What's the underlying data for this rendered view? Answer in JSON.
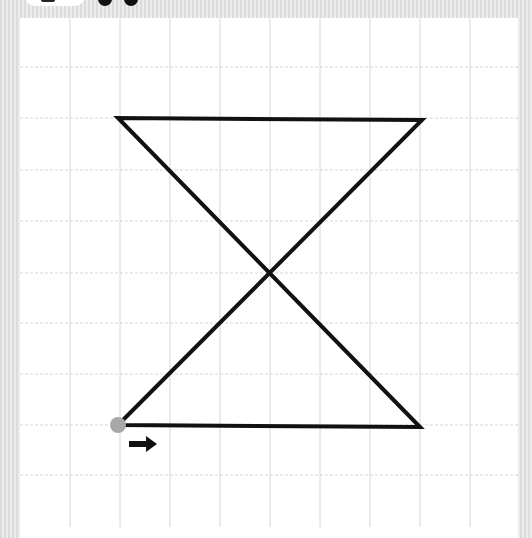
{
  "canvas": {
    "background_color": "#e4e4e4",
    "board_color": "#ffffff",
    "grid": {
      "line_color": "#d6d6d6",
      "vertical_x": [
        70,
        120,
        170,
        220,
        270,
        320,
        370,
        420,
        470
      ],
      "horizontal_y": [
        67,
        118,
        170,
        221,
        273,
        323,
        374,
        425,
        475
      ]
    },
    "path": {
      "stroke_color": "#111111",
      "stroke_width": 4,
      "points": [
        [
          118,
          425
        ],
        [
          420,
          427
        ],
        [
          118,
          118
        ],
        [
          422,
          120
        ],
        [
          118,
          425
        ]
      ]
    },
    "start_point": {
      "x": 118,
      "y": 425,
      "color": "#a8a8a8",
      "radius": 8
    },
    "direction_arrow": {
      "icon": "arrow-right-icon",
      "x": 129,
      "y": 444,
      "color": "#111111"
    }
  },
  "top_bar": {
    "pill": "partially-visible",
    "dots": 2
  }
}
